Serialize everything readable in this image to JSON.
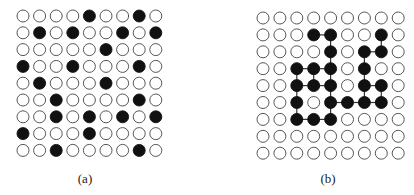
{
  "figure": {
    "panels": [
      {
        "id": "a",
        "caption": "(a)",
        "rows": 9,
        "cols": 9,
        "origin": {
          "x": 23,
          "y": 16
        },
        "step": {
          "x": 16.6,
          "y": 16.8
        },
        "radius": 6,
        "caption_pos": {
          "x": 85,
          "y": 171
        },
        "connected": false,
        "filled": [
          [
            0,
            4
          ],
          [
            0,
            7
          ],
          [
            1,
            1
          ],
          [
            1,
            3
          ],
          [
            1,
            6
          ],
          [
            1,
            8
          ],
          [
            2,
            5
          ],
          [
            3,
            0
          ],
          [
            3,
            3
          ],
          [
            3,
            7
          ],
          [
            4,
            1
          ],
          [
            4,
            5
          ],
          [
            5,
            2
          ],
          [
            5,
            7
          ],
          [
            6,
            2
          ],
          [
            6,
            4
          ],
          [
            6,
            6
          ],
          [
            6,
            8
          ],
          [
            7,
            0
          ],
          [
            7,
            4
          ],
          [
            8,
            2
          ],
          [
            8,
            7
          ]
        ]
      },
      {
        "id": "b",
        "caption": "(b)",
        "rows": 9,
        "cols": 9,
        "origin": {
          "x": 263,
          "y": 18
        },
        "step": {
          "x": 16.9,
          "y": 16.9
        },
        "radius": 6,
        "caption_pos": {
          "x": 328,
          "y": 171
        },
        "connected": true,
        "filled": [
          [
            1,
            3
          ],
          [
            1,
            4
          ],
          [
            1,
            7
          ],
          [
            2,
            4
          ],
          [
            2,
            6
          ],
          [
            2,
            7
          ],
          [
            3,
            2
          ],
          [
            3,
            3
          ],
          [
            3,
            4
          ],
          [
            3,
            6
          ],
          [
            4,
            2
          ],
          [
            4,
            3
          ],
          [
            4,
            4
          ],
          [
            4,
            6
          ],
          [
            4,
            7
          ],
          [
            5,
            2
          ],
          [
            5,
            4
          ],
          [
            5,
            5
          ],
          [
            5,
            6
          ],
          [
            5,
            7
          ],
          [
            6,
            2
          ],
          [
            6,
            3
          ],
          [
            6,
            4
          ]
        ]
      }
    ],
    "colors": {
      "filled": "#111111",
      "outline": "#444444",
      "empty": "#ffffff",
      "link": "#333333"
    }
  }
}
